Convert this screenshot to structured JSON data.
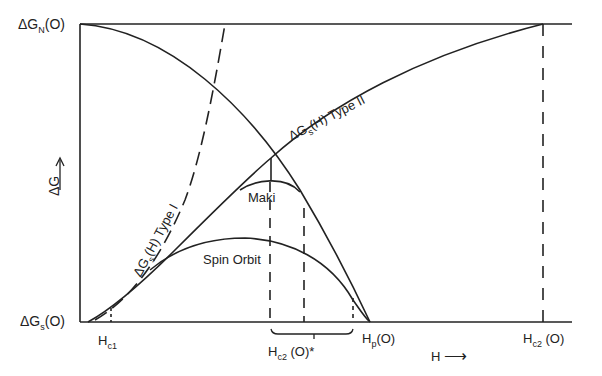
{
  "diagram": {
    "y_axis": {
      "label": "ΔG",
      "arrow": "→",
      "top_tick": {
        "main": "ΔG",
        "sub": "N",
        "tail": "(O)"
      },
      "bottom_tick": {
        "main": "ΔG",
        "sub": "s",
        "tail": "(O)"
      }
    },
    "x_axis": {
      "label": "H",
      "arrow": "⟶",
      "ticks": [
        {
          "main": "H",
          "sub": "c1",
          "tail": ""
        },
        {
          "main": "H",
          "sub": "c2",
          "tail": " (O)*"
        },
        {
          "main": "H",
          "sub": "p",
          "tail": "(O)"
        },
        {
          "main": "H",
          "sub": "c2",
          "tail": " (O)"
        }
      ]
    },
    "curves": [
      {
        "name": "ΔG_N(H) normal state",
        "label": ""
      },
      {
        "name": "Type I",
        "label": {
          "main": "ΔG",
          "sub": "s",
          "tail": "(H) Type I"
        }
      },
      {
        "name": "Type II",
        "label": {
          "main": "ΔG",
          "sub": "s",
          "tail": "(H) Type II"
        }
      },
      {
        "name": "Maki",
        "label": "Maki"
      },
      {
        "name": "Spin Orbit",
        "label": "Spin Orbit"
      }
    ]
  }
}
